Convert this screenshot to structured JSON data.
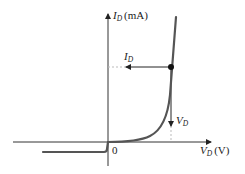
{
  "diagram": {
    "type": "diode-characteristic-curve",
    "y_axis": {
      "symbol": "I",
      "subscript": "D",
      "unit": "(mA)"
    },
    "x_axis": {
      "symbol": "V",
      "subscript": "D",
      "unit": "(V)"
    },
    "origin_label": "0",
    "operating_point_labels": {
      "current": {
        "symbol": "I",
        "subscript": "D"
      },
      "voltage": {
        "symbol": "V",
        "subscript": "D"
      }
    },
    "colors": {
      "axes": "#333333",
      "curve": "#555555",
      "point": "#111111",
      "dashed": "#bbbbbb"
    }
  }
}
